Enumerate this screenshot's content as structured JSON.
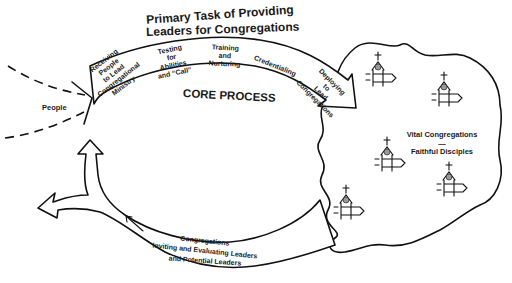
{
  "diagram": {
    "title_line1": "Primary Task of Providing",
    "title_line2": "Leaders for Congregations",
    "core_label": "CORE PROCESS",
    "input_label": "People",
    "steps": [
      {
        "lines": [
          "Receiving",
          "People",
          "to Lead",
          "Congregational",
          "Ministry"
        ]
      },
      {
        "lines": [
          "Testing",
          "for",
          "Abilities",
          "and “Call”"
        ]
      },
      {
        "lines": [
          "Training",
          "and",
          "Nurturing"
        ]
      },
      {
        "lines": [
          "Credentialing"
        ]
      },
      {
        "lines": [
          "Deploying",
          "to",
          "Lead",
          "Congregations"
        ]
      }
    ],
    "outcome": {
      "line1": "Vital Congregations",
      "separator": "—",
      "line2": "Faithful Disciples"
    },
    "feedback": {
      "line1": "Congregations",
      "line2": "Inviting and Evaluating Leaders",
      "line3": "and Potential Leaders"
    },
    "church_icons": [
      {
        "x": 372,
        "y": 60
      },
      {
        "x": 438,
        "y": 80
      },
      {
        "x": 384,
        "y": 145
      },
      {
        "x": 446,
        "y": 167
      },
      {
        "x": 344,
        "y": 187
      }
    ],
    "colors": {
      "ink": "#111111",
      "background": "#ffffff"
    }
  }
}
